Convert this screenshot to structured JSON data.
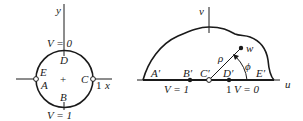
{
  "left_diagram": {
    "name": "z-plane unit disk",
    "axes": {
      "x_label": "x",
      "y_label": "y",
      "x_tick_label": "1"
    },
    "boundary_labels": {
      "top": "V = 0",
      "bottom": "V = 1"
    },
    "points": {
      "D": "D",
      "B": "B",
      "E": "E",
      "A": "A",
      "C": "C"
    },
    "center_mark": "+"
  },
  "right_diagram": {
    "name": "w-plane upper half region",
    "axes": {
      "u_label": "u",
      "v_label": "v"
    },
    "points": {
      "A_prime": "A′",
      "B_prime": "B′",
      "C_prime": "C′",
      "D_prime": "D′",
      "E_prime": "E′",
      "w": "w"
    },
    "segment_labels": {
      "rho": "ρ",
      "phi": "ϕ"
    },
    "axis_labels": {
      "left_segment": "V = 1",
      "tick_one": "1",
      "right_segment": "V = 0"
    }
  },
  "colors": {
    "stroke": "#1a1a1a",
    "background": "#ffffff"
  }
}
